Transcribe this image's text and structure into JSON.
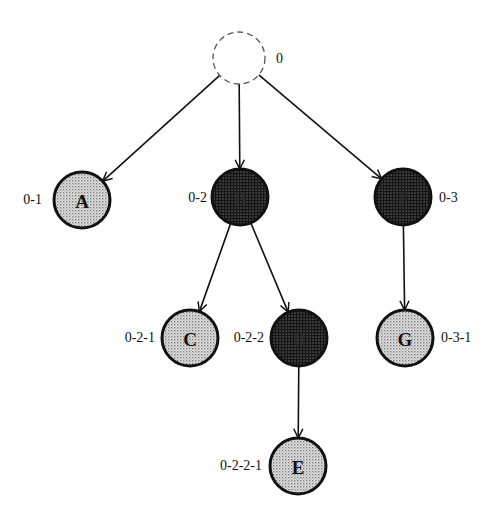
{
  "diagram": {
    "type": "tree",
    "colors": {
      "light_fill": "#d4d4d4",
      "dark_fill": "#1e1e1e",
      "stroke": "#111111",
      "light_text": "#111111",
      "dark_text": "#2a2a2a"
    },
    "nodes": [
      {
        "id": "root",
        "letter": "",
        "label": "0",
        "style": "dashed",
        "cx": 239,
        "cy": 58,
        "r": 26,
        "label_x": 276,
        "label_y": 63,
        "label_anchor": "start"
      },
      {
        "id": "A",
        "letter": "A",
        "label": "0-1",
        "style": "light",
        "cx": 82,
        "cy": 200,
        "r": 28,
        "label_x": 42,
        "label_y": 204,
        "label_anchor": "end"
      },
      {
        "id": "B",
        "letter": "B",
        "label": "0-2",
        "style": "dark",
        "cx": 240,
        "cy": 197,
        "r": 28,
        "label_x": 207,
        "label_y": 202,
        "label_anchor": "end"
      },
      {
        "id": "F",
        "letter": "F",
        "label": "0-3",
        "style": "dark",
        "cx": 403,
        "cy": 197,
        "r": 28,
        "label_x": 439,
        "label_y": 202,
        "label_anchor": "start"
      },
      {
        "id": "C",
        "letter": "C",
        "label": "0-2-1",
        "style": "light",
        "cx": 190,
        "cy": 338,
        "r": 28,
        "label_x": 155,
        "label_y": 342,
        "label_anchor": "end"
      },
      {
        "id": "D",
        "letter": "D",
        "label": "0-2-2",
        "style": "dark",
        "cx": 299,
        "cy": 338,
        "r": 28,
        "label_x": 264,
        "label_y": 342,
        "label_anchor": "end"
      },
      {
        "id": "G",
        "letter": "G",
        "label": "0-3-1",
        "style": "light",
        "cx": 405,
        "cy": 338,
        "r": 28,
        "label_x": 441,
        "label_y": 342,
        "label_anchor": "start"
      },
      {
        "id": "E",
        "letter": "E",
        "label": "0-2-2-1",
        "style": "light",
        "cx": 298,
        "cy": 466,
        "r": 28,
        "label_x": 262,
        "label_y": 470,
        "label_anchor": "end"
      }
    ],
    "edges": [
      {
        "from": "root",
        "to": "A"
      },
      {
        "from": "root",
        "to": "B"
      },
      {
        "from": "root",
        "to": "F"
      },
      {
        "from": "B",
        "to": "C"
      },
      {
        "from": "B",
        "to": "D"
      },
      {
        "from": "F",
        "to": "G"
      },
      {
        "from": "D",
        "to": "E"
      }
    ]
  }
}
